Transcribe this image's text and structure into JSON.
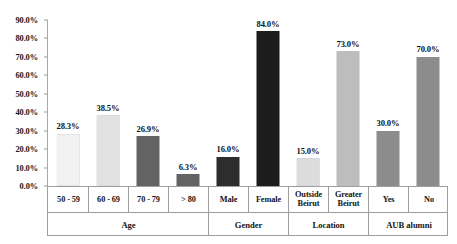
{
  "chart_data": {
    "type": "bar",
    "title": "",
    "subtitle": "",
    "xlabel": "",
    "ylabel": "",
    "ylim": [
      0,
      90
    ],
    "ytick_step": 10,
    "grid": false,
    "legend": "none",
    "value_format": "percent-one-decimal",
    "categories": [
      "50 - 59",
      "60 - 69",
      "70 - 79",
      "> 80",
      "Male",
      "Female",
      "Outside Beirut",
      "Greater Beirut",
      "Yes",
      "No"
    ],
    "values": [
      28.3,
      38.5,
      26.9,
      6.3,
      16.0,
      84.0,
      15.0,
      73.0,
      30.0,
      70.0
    ],
    "data_labels": [
      "28.3%",
      "38.5%",
      "26.9%",
      "6.3%",
      "16.0%",
      "84.0%",
      "15.0%",
      "73.0%",
      "30.0%",
      "70.0%"
    ],
    "bar_colors": [
      "#f2f2f2",
      "#e2e2e2",
      "#636363",
      "#636363",
      "#2d2d2d",
      "#1c1c1c",
      "#dcdcdc",
      "#bdbdbd",
      "#8c8c8c",
      "#8c8c8c"
    ],
    "ytick_labels": [
      "0.0%",
      "10.0%",
      "20.0%",
      "30.0%",
      "40.0%",
      "50.0%",
      "60.0%",
      "70.0%",
      "80.0%",
      "90.0%"
    ],
    "ytick_values": [
      0,
      10,
      20,
      30,
      40,
      50,
      60,
      70,
      80,
      90
    ],
    "groups": [
      {
        "label": "Age",
        "span": 4
      },
      {
        "label": "Gender",
        "span": 2
      },
      {
        "label": "Location",
        "span": 2
      },
      {
        "label": "AUB alumni",
        "span": 2
      }
    ],
    "axis_color": "#a8a8a8",
    "text_color": "#141414",
    "background": "#ffffff"
  }
}
